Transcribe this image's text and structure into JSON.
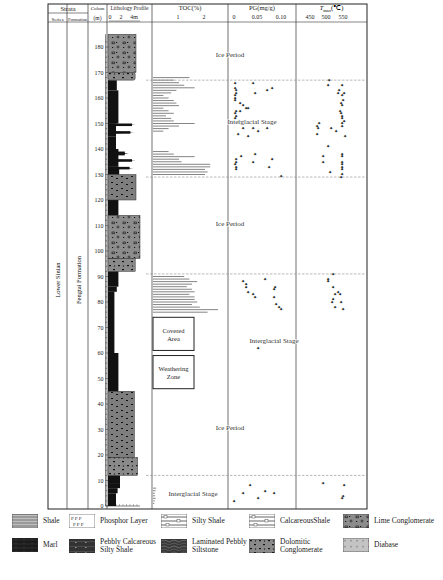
{
  "header": {
    "strata": "Strata",
    "series": "Series",
    "formation": "Formation",
    "column": "Colum",
    "depth_unit": "(m)",
    "lithology": "Lithology Profile",
    "lith_scale": [
      "0",
      "2",
      "4m"
    ],
    "toc": "TOC(%)",
    "toc_ticks": [
      "1",
      "2"
    ],
    "pg": "PG(mg/g)",
    "pg_ticks": [
      "0",
      "0.05",
      "0.10"
    ],
    "tmax": "T_max(℃)",
    "tmax_ticks": [
      "450",
      "500",
      "550"
    ]
  },
  "strata": {
    "series_name": "Lower Sinian",
    "formation_name": "Fengtai Formation"
  },
  "depth_ticks": [
    0,
    10,
    20,
    30,
    40,
    50,
    60,
    70,
    80,
    90,
    100,
    110,
    120,
    130,
    140,
    150,
    160,
    170,
    180
  ],
  "stage_boundaries_m": [
    12,
    91,
    129,
    167
  ],
  "stage_labels": [
    {
      "text": "Ice Period",
      "depth": 176
    },
    {
      "text": "Interglacial Stage",
      "depth": 150
    },
    {
      "text": "Ice Period",
      "depth": 110
    },
    {
      "text": "Interglacial Stage",
      "depth": 64
    },
    {
      "text": "Ice Period",
      "depth": 30
    },
    {
      "text": "Interglacial Stage",
      "depth": 4
    }
  ],
  "boxes": [
    {
      "label_line1": "Covered",
      "label_line2": "Area",
      "top": 74,
      "bottom": 61
    },
    {
      "label_line1": "Weathering",
      "label_line2": "Zone",
      "top": 59,
      "bottom": 46
    }
  ],
  "legend": [
    {
      "name": "Shale",
      "pattern": "shale"
    },
    {
      "name": "Phosphor Layer",
      "pattern": "phosphor"
    },
    {
      "name": "Silty Shale",
      "pattern": "silty"
    },
    {
      "name": "CalcareousShale",
      "pattern": "calc"
    },
    {
      "name": "Lime Conglomerate",
      "pattern": "lime"
    },
    {
      "name": "Marl",
      "pattern": "marl"
    },
    {
      "name": "Pebbly Calcareous Silty Shale",
      "pattern": "pebbly"
    },
    {
      "name": "Laminated Pebbly Siltstone",
      "pattern": "laminated"
    },
    {
      "name": "Dolomitic Conglomerate",
      "pattern": "dolo"
    },
    {
      "name": "Diabase",
      "pattern": "diabase"
    }
  ],
  "chart_data": {
    "type": "scatter",
    "ylabel": "Depth (m)",
    "ylim": [
      0,
      185
    ],
    "series": [
      {
        "name": "TOC(%)",
        "type": "bar",
        "xlim": [
          0,
          3
        ],
        "points": [
          [
            0.05,
            1
          ],
          [
            0.07,
            2
          ],
          [
            0.1,
            3
          ],
          [
            0.08,
            4
          ],
          [
            0.07,
            5
          ],
          [
            0.1,
            6
          ],
          [
            0.12,
            7
          ],
          [
            2.1,
            76
          ],
          [
            2.5,
            77
          ],
          [
            1.8,
            78
          ],
          [
            1.5,
            79
          ],
          [
            1.7,
            80
          ],
          [
            1.6,
            81
          ],
          [
            1.6,
            82
          ],
          [
            1.4,
            83
          ],
          [
            1.6,
            84
          ],
          [
            1.5,
            85
          ],
          [
            1.3,
            86
          ],
          [
            1.5,
            87
          ],
          [
            1.7,
            88
          ],
          [
            1.4,
            89
          ],
          [
            1.2,
            90
          ],
          [
            2.0,
            130
          ],
          [
            2.1,
            131
          ],
          [
            2.0,
            132
          ],
          [
            2.2,
            133
          ],
          [
            2.2,
            134
          ],
          [
            1.1,
            135
          ],
          [
            1.0,
            136
          ],
          [
            1.6,
            137
          ],
          [
            0.8,
            138
          ],
          [
            0.6,
            139
          ],
          [
            0.4,
            147
          ],
          [
            0.6,
            148
          ],
          [
            1.0,
            149
          ],
          [
            1.6,
            150
          ],
          [
            0.8,
            151
          ],
          [
            0.7,
            152
          ],
          [
            0.5,
            153
          ],
          [
            0.8,
            154
          ],
          [
            0.6,
            155
          ],
          [
            0.4,
            156
          ],
          [
            1.0,
            157
          ],
          [
            0.9,
            158
          ],
          [
            0.8,
            159
          ],
          [
            0.6,
            160
          ],
          [
            0.4,
            161
          ],
          [
            0.7,
            162
          ],
          [
            0.9,
            163
          ],
          [
            1.6,
            164
          ],
          [
            1.2,
            165
          ],
          [
            1.0,
            166
          ],
          [
            0.8,
            167
          ],
          [
            1.4,
            168
          ]
        ]
      },
      {
        "name": "PG(mg/g)",
        "type": "scatter",
        "xlim": [
          -0.01,
          0.115
        ],
        "points": [
          [
            0.0,
            2
          ],
          [
            0.02,
            5
          ],
          [
            0.035,
            8
          ],
          [
            0.05,
            3
          ],
          [
            0.065,
            6
          ],
          [
            0.085,
            5
          ],
          [
            0.1,
            129.5
          ],
          [
            0.004,
            132
          ],
          [
            0.004,
            133
          ],
          [
            0.003,
            134
          ],
          [
            0.005,
            135
          ],
          [
            0.005,
            136
          ],
          [
            0.015,
            137
          ],
          [
            0.04,
            135
          ],
          [
            0.045,
            138
          ],
          [
            0.075,
            133
          ],
          [
            0.08,
            136
          ],
          [
            0.009,
            146
          ],
          [
            0.03,
            145
          ],
          [
            0.05,
            147
          ],
          [
            0.04,
            148
          ],
          [
            0.07,
            148
          ],
          [
            0.02,
            148
          ],
          [
            0.015,
            150
          ],
          [
            0.01,
            151
          ],
          [
            0.003,
            152
          ],
          [
            0.005,
            153
          ],
          [
            0.003,
            154
          ],
          [
            0.005,
            155
          ],
          [
            0.012,
            155
          ],
          [
            0.02,
            157
          ],
          [
            0.025,
            156
          ],
          [
            0.03,
            156
          ],
          [
            0.012,
            158
          ],
          [
            0.003,
            159
          ],
          [
            0.003,
            160
          ],
          [
            0.003,
            161
          ],
          [
            0.004,
            162
          ],
          [
            0.005,
            163
          ],
          [
            0.003,
            164
          ],
          [
            0.045,
            162
          ],
          [
            0.07,
            163
          ],
          [
            0.08,
            164
          ],
          [
            0.003,
            166
          ],
          [
            0.04,
            166
          ],
          [
            0.02,
            88
          ],
          [
            0.025,
            86
          ],
          [
            0.025,
            87
          ],
          [
            0.03,
            84
          ],
          [
            0.04,
            83
          ],
          [
            0.045,
            82
          ],
          [
            0.065,
            89
          ],
          [
            0.085,
            85
          ],
          [
            0.085,
            82
          ],
          [
            0.088,
            86
          ],
          [
            0.09,
            79
          ],
          [
            0.095,
            78
          ],
          [
            0.1,
            77
          ],
          [
            0.05,
            62
          ]
        ]
      },
      {
        "name": "Tmax(℃)",
        "type": "scatter",
        "xlim": [
          420,
          600
        ],
        "points": [
          [
            490,
            9
          ],
          [
            549,
            4
          ],
          [
            548,
            3
          ],
          [
            552,
            8
          ],
          [
            510,
            131
          ],
          [
            545,
            129
          ],
          [
            548,
            130
          ],
          [
            546,
            132
          ],
          [
            548,
            133
          ],
          [
            548,
            134
          ],
          [
            546,
            135
          ],
          [
            548,
            137
          ],
          [
            548,
            138
          ],
          [
            488,
            135
          ],
          [
            488,
            137
          ],
          [
            505,
            141
          ],
          [
            515,
            148
          ],
          [
            530,
            147
          ],
          [
            555,
            145
          ],
          [
            470,
            149
          ],
          [
            475,
            148
          ],
          [
            478,
            150
          ],
          [
            472,
            146
          ],
          [
            540,
            155
          ],
          [
            543,
            154
          ],
          [
            546,
            153
          ],
          [
            548,
            152
          ],
          [
            552,
            151
          ],
          [
            547,
            150
          ],
          [
            548,
            149
          ],
          [
            545,
            158
          ],
          [
            546,
            157
          ],
          [
            550,
            159
          ],
          [
            547,
            161
          ],
          [
            552,
            162
          ],
          [
            535,
            162
          ],
          [
            538,
            163
          ],
          [
            548,
            165
          ],
          [
            505,
            165
          ],
          [
            507,
            167
          ],
          [
            520,
            91
          ],
          [
            505,
            89
          ],
          [
            505,
            88
          ],
          [
            520,
            86
          ],
          [
            535,
            84
          ],
          [
            525,
            83
          ],
          [
            540,
            83
          ],
          [
            517,
            80
          ],
          [
            520,
            81
          ],
          [
            525,
            78
          ],
          [
            545,
            80
          ],
          [
            550,
            77
          ]
        ]
      }
    ]
  }
}
